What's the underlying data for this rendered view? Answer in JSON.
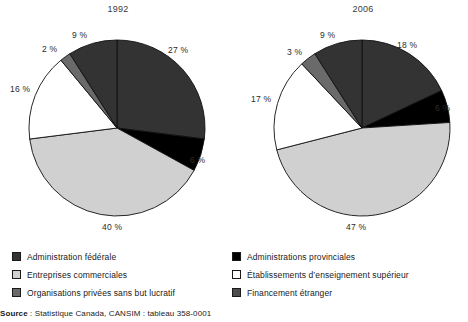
{
  "chart_data": [
    {
      "type": "pie",
      "title": "1992",
      "categories": [
        "Administration fédérale",
        "Administrations provinciales",
        "Entreprises commerciales",
        "Établissements d’enseignement supérieur",
        "Organisations privées sans but lucratif",
        "Financement étranger"
      ],
      "values": [
        27,
        6,
        40,
        16,
        2,
        9
      ],
      "labels": [
        "27 %",
        "6 %",
        "40 %",
        "16 %",
        "2 %",
        "9 %"
      ],
      "colors": [
        "#333333",
        "#000000",
        "#d0d0d0",
        "#ffffff",
        "#6a6a6a",
        "#333333"
      ],
      "start_angle_deg": 0,
      "direction": "clockwise",
      "legend_position": "bottom"
    },
    {
      "type": "pie",
      "title": "2006",
      "categories": [
        "Administration fédérale",
        "Administrations provinciales",
        "Entreprises commerciales",
        "Établissements d’enseignement supérieur",
        "Organisations privées sans but lucratif",
        "Financement étranger"
      ],
      "values": [
        18,
        6,
        47,
        17,
        3,
        9
      ],
      "labels": [
        "18 %",
        "6 %",
        "47 %",
        "17 %",
        "3 %",
        "9 %"
      ],
      "colors": [
        "#333333",
        "#000000",
        "#d0d0d0",
        "#ffffff",
        "#6a6a6a",
        "#333333"
      ],
      "start_angle_deg": 0,
      "direction": "clockwise",
      "legend_position": "bottom"
    }
  ],
  "charts": {
    "left": {
      "title": "1992",
      "pct": {
        "p27": "27 %",
        "p6": "6 %",
        "p40": "40 %",
        "p16": "16 %",
        "p2": "2 %",
        "p9": "9 %"
      }
    },
    "right": {
      "title": "2006",
      "pct": {
        "p18": "18 %",
        "p6": "6 %",
        "p47": "47 %",
        "p17": "17 %",
        "p3": "3 %",
        "p9": "9 %"
      }
    }
  },
  "legend": {
    "left_column": [
      {
        "label": "Administration fédérale",
        "color": "#333333"
      },
      {
        "label": "Entreprises commerciales",
        "color": "#d0d0d0"
      },
      {
        "label": "Organisations privées sans but lucratif",
        "color": "#6a6a6a"
      }
    ],
    "right_column": [
      {
        "label": "Administrations provinciales",
        "color": "#000000"
      },
      {
        "label": "Établissements d’enseignement supérieur",
        "color": "#ffffff"
      },
      {
        "label": "Financement étranger",
        "color": "#4d4d4d"
      }
    ]
  },
  "source": {
    "prefix": "Source",
    "text": " : Statistique Canada, CANSIM : tableau 358-0001"
  }
}
